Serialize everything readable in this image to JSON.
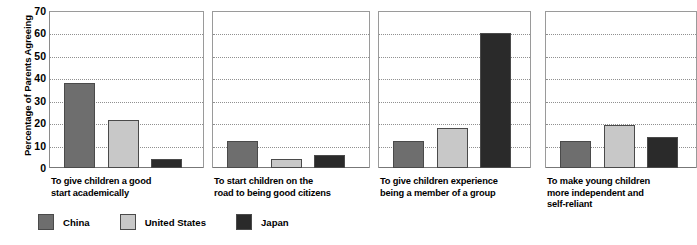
{
  "chart_data": {
    "type": "bar",
    "title": "",
    "xlabel": "",
    "ylabel": "Percentage of Parents Agreeing",
    "ylim": [
      0,
      70
    ],
    "ytick_values": [
      0,
      10,
      20,
      30,
      40,
      50,
      60,
      70
    ],
    "ytick_labels": [
      "0",
      "10",
      "20",
      "30",
      "40",
      "50",
      "60",
      "70"
    ],
    "grid": true,
    "legend_position": "bottom-left",
    "categories": [
      "To give children a good\nstart academically",
      "To start children on the\nroad to being good citizens",
      "To give children experience\nbeing a member of a group",
      "To make young children\nmore independent and\nself-reliant"
    ],
    "series": [
      {
        "name": "China",
        "color": "#6e6e6e",
        "values": [
          38,
          12,
          12,
          12
        ]
      },
      {
        "name": "United States",
        "color": "#c8c8c8",
        "values": [
          21.5,
          4,
          18,
          19
        ]
      },
      {
        "name": "Japan",
        "color": "#2a2a2a",
        "values": [
          4,
          6,
          60,
          14
        ]
      }
    ]
  },
  "legend": {
    "items": [
      {
        "label": "China"
      },
      {
        "label": "United States"
      },
      {
        "label": "Japan"
      }
    ]
  }
}
